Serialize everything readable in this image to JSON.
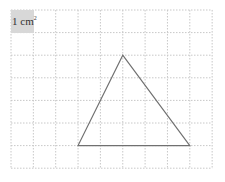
{
  "grid": {
    "origin_x": 11,
    "origin_y": 10,
    "cols": 9,
    "rows": 7,
    "cell_w": 22.35,
    "cell_h": 22.6,
    "line_color": "#c8c8c8"
  },
  "unit_label": {
    "text": "1 cm",
    "superscript": "2",
    "background": "#d8d8d8"
  },
  "triangle": {
    "vertices_grid": [
      [
        5,
        2
      ],
      [
        3,
        6
      ],
      [
        8,
        6
      ]
    ],
    "stroke": "#707070"
  }
}
